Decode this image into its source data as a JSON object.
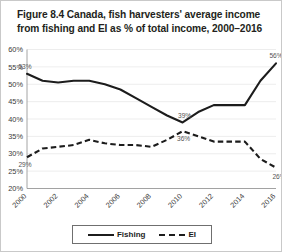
{
  "figure": {
    "title": "Figure 8.4 Canada, fish harvesters' average income from fishing and EI as % of total income, 2000–2016"
  },
  "legend": {
    "position": "bottom-center",
    "entries": [
      {
        "label": "Fishing",
        "style": "solid"
      },
      {
        "label": "EI",
        "style": "dashed"
      }
    ]
  },
  "chart_data": {
    "type": "line",
    "title": "Figure 8.4 Canada, fish harvesters' average income from fishing and EI as % of total income, 2000–2016",
    "xlabel": "",
    "ylabel": "",
    "grid": true,
    "ylim": [
      20,
      60
    ],
    "ytick_labels": [
      "60%",
      "55%",
      "50%",
      "45%",
      "40%",
      "35%",
      "30%",
      "25%",
      "20%"
    ],
    "ytick_values": [
      60,
      55,
      50,
      45,
      40,
      35,
      30,
      25,
      20
    ],
    "x": [
      2000,
      2001,
      2002,
      2003,
      2004,
      2005,
      2006,
      2007,
      2008,
      2009,
      2010,
      2011,
      2012,
      2013,
      2014,
      2015,
      2016
    ],
    "xtick_labels": [
      "2000",
      "2002",
      "2004",
      "2006",
      "2008",
      "2010",
      "2012",
      "2014",
      "2016"
    ],
    "xtick_values": [
      2000,
      2002,
      2004,
      2006,
      2008,
      2010,
      2012,
      2014,
      2016
    ],
    "series": [
      {
        "name": "Fishing",
        "style": "solid",
        "values": [
          53,
          51,
          50.5,
          51,
          51,
          50,
          48.5,
          46,
          43.5,
          41,
          39,
          42,
          44,
          44,
          44,
          51,
          56
        ]
      },
      {
        "name": "EI",
        "style": "dashed",
        "values": [
          29,
          31.5,
          32,
          32.5,
          34,
          33,
          32.5,
          32.5,
          32,
          34,
          36.5,
          35,
          33.5,
          33.5,
          33.5,
          28.5,
          26
        ]
      }
    ],
    "annotations": [
      {
        "text": "53%",
        "series": "Fishing",
        "x": 2000,
        "y": 53
      },
      {
        "text": "39%",
        "series": "Fishing",
        "x": 2010,
        "y": 39
      },
      {
        "text": "56%",
        "series": "Fishing",
        "x": 2016,
        "y": 56
      },
      {
        "text": "29%",
        "series": "EI",
        "x": 2000,
        "y": 29
      },
      {
        "text": "36%",
        "series": "EI",
        "x": 2010,
        "y": 36.5
      },
      {
        "text": "26%",
        "series": "EI",
        "x": 2016,
        "y": 26
      }
    ]
  }
}
